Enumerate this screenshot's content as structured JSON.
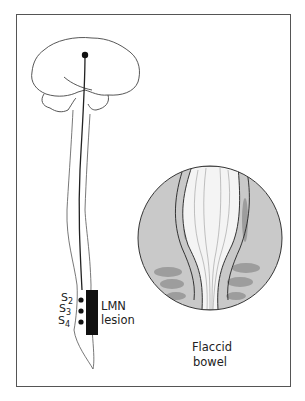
{
  "figure": {
    "lesion_label_line1": "LMN",
    "lesion_label_line2": "lesion",
    "segments": [
      {
        "letter": "S",
        "num": "2"
      },
      {
        "letter": "S",
        "num": "3"
      },
      {
        "letter": "S",
        "num": "4"
      }
    ],
    "inset_label_line1": "Flaccid",
    "inset_label_line2": "bowel"
  },
  "colors": {
    "frame": "#555555",
    "line": "#333333",
    "inset_fill": "#c9c9c9",
    "lesion_box": "#111111"
  }
}
